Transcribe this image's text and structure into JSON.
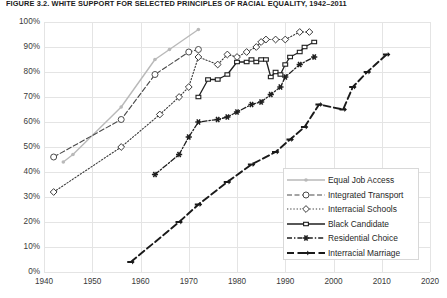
{
  "chart_data": {
    "type": "line",
    "title": "FIGURE 3.2. WHITE SUPPORT FOR SELECTED PRINCIPLES OF RACIAL EQUALITY, 1942–2011",
    "xlabel": "",
    "ylabel": "",
    "xlim": [
      1940,
      2020
    ],
    "ylim": [
      0,
      100
    ],
    "grid": true,
    "legend_position": "inside-lower-right",
    "xticks": [
      "1940",
      "1950",
      "1960",
      "1970",
      "1980",
      "1990",
      "2000",
      "2010",
      "2020"
    ],
    "xtick_values": [
      1940,
      1950,
      1960,
      1970,
      1980,
      1990,
      2000,
      2010,
      2020
    ],
    "yticks": [
      "0%",
      "10%",
      "20%",
      "30%",
      "40%",
      "50%",
      "60%",
      "70%",
      "80%",
      "90%",
      "100%"
    ],
    "ytick_values": [
      0,
      10,
      20,
      30,
      40,
      50,
      60,
      70,
      80,
      90,
      100
    ],
    "series": [
      {
        "name": "Equal Job Access",
        "color": "#b9b9b9",
        "style": "solid-light",
        "marker": "dot",
        "x": [
          1944,
          1946,
          1956,
          1963,
          1966,
          1972
        ],
        "values": [
          44,
          47,
          66,
          85,
          89,
          97
        ]
      },
      {
        "name": "Integrated Transport",
        "color": "#4a4a4a",
        "style": "dash-dot-open-circle",
        "marker": "open-circle",
        "x": [
          1942,
          1956,
          1963,
          1970,
          1972
        ],
        "values": [
          46,
          61,
          79,
          88,
          89
        ]
      },
      {
        "name": "Interracial Schools",
        "color": "#3a3a3a",
        "style": "dotted",
        "marker": "open-diamond",
        "x": [
          1942,
          1956,
          1964,
          1968,
          1970,
          1972,
          1976,
          1978,
          1980,
          1982,
          1984,
          1985,
          1986,
          1988,
          1990,
          1993,
          1995
        ],
        "values": [
          32,
          50,
          63,
          70,
          74,
          86,
          83,
          87,
          86,
          88,
          90,
          92,
          93,
          93,
          93,
          96,
          96
        ]
      },
      {
        "name": "Black Candidate",
        "color": "#1f1f1f",
        "style": "solid",
        "marker": "filled-square",
        "x": [
          1972,
          1974,
          1976,
          1978,
          1980,
          1982,
          1983,
          1984,
          1985,
          1986,
          1987,
          1988,
          1989,
          1990,
          1991,
          1993,
          1994,
          1996
        ],
        "values": [
          70,
          77,
          77,
          79,
          84,
          84,
          85,
          84,
          85,
          85,
          78,
          80,
          79,
          83,
          86,
          88,
          90,
          92
        ]
      },
      {
        "name": "Residential Choice",
        "color": "#1f1f1f",
        "style": "dash-dot",
        "marker": "filled-star",
        "x": [
          1963,
          1968,
          1970,
          1972,
          1976,
          1978,
          1980,
          1983,
          1985,
          1987,
          1989,
          1990,
          1993,
          1996
        ],
        "values": [
          39,
          47,
          54,
          60,
          61,
          62,
          64,
          67,
          68,
          71,
          74,
          78,
          83,
          86
        ]
      },
      {
        "name": "Interracial Marriage",
        "color": "#1a1a1a",
        "style": "long-dash",
        "marker": "filled-arrow",
        "x": [
          1958,
          1968,
          1972,
          1978,
          1983,
          1988,
          1991,
          1994,
          1997,
          2002,
          2004,
          2007,
          2011
        ],
        "values": [
          4,
          20,
          27,
          36,
          43,
          48,
          53,
          58,
          67,
          65,
          74,
          80,
          87
        ]
      }
    ]
  },
  "legend": {
    "items": [
      {
        "label": "Equal Job Access",
        "marker": "dot",
        "style": "solid-light"
      },
      {
        "label": "Integrated Transport",
        "marker": "open-circle",
        "style": "dash-dot"
      },
      {
        "label": "Interracial Schools",
        "marker": "open-diamond",
        "style": "dotted"
      },
      {
        "label": "Black Candidate",
        "marker": "filled-square",
        "style": "solid"
      },
      {
        "label": "Residential Choice",
        "marker": "filled-star",
        "style": "dash-dot"
      },
      {
        "label": "Interracial Marriage",
        "marker": "filled-arrow",
        "style": "long-dash"
      }
    ]
  }
}
